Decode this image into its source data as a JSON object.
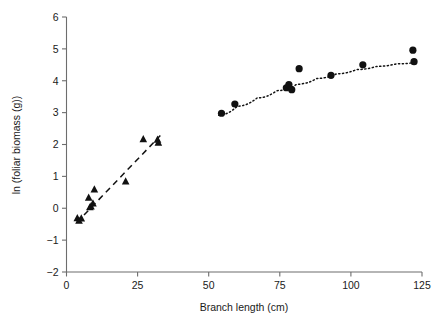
{
  "chart_data": {
    "type": "scatter",
    "title": "",
    "xlabel": "Branch length (cm)",
    "ylabel": "ln (foliar biomass (g))",
    "xlim": [
      0,
      125
    ],
    "ylim": [
      -2,
      6
    ],
    "xticks": [
      0,
      25,
      50,
      75,
      100,
      125
    ],
    "xtick_labels": [
      "0",
      "25",
      "50",
      "75",
      "100",
      "125"
    ],
    "yticks": [
      -2,
      -1,
      0,
      1,
      2,
      3,
      4,
      5,
      6
    ],
    "ytick_labels": [
      "−2",
      "−1",
      "0",
      "1",
      "2",
      "3",
      "4",
      "5",
      "6"
    ],
    "grid": false,
    "legend": "none",
    "marker_color": "#111111",
    "axis_color": "#6d6d6d",
    "series": [
      {
        "name": "small branches",
        "marker": "triangle",
        "points": [
          {
            "x": 3.8,
            "y": -0.32
          },
          {
            "x": 4.4,
            "y": -0.4
          },
          {
            "x": 5.2,
            "y": -0.33
          },
          {
            "x": 7.8,
            "y": 0.32
          },
          {
            "x": 8.2,
            "y": 0.02
          },
          {
            "x": 8.6,
            "y": 0.05
          },
          {
            "x": 9.3,
            "y": 0.14
          },
          {
            "x": 9.8,
            "y": 0.58
          },
          {
            "x": 20.8,
            "y": 0.83
          },
          {
            "x": 27.0,
            "y": 2.16
          },
          {
            "x": 32.0,
            "y": 2.14
          },
          {
            "x": 32.3,
            "y": 2.05
          }
        ],
        "fit": {
          "style": "dashed",
          "x_start": 3.6,
          "y_start": -0.45,
          "x_end": 33.0,
          "y_end": 2.28
        }
      },
      {
        "name": "large branches",
        "marker": "circle",
        "points": [
          {
            "x": 54.5,
            "y": 2.98
          },
          {
            "x": 59.2,
            "y": 3.27
          },
          {
            "x": 77.3,
            "y": 3.78
          },
          {
            "x": 78.2,
            "y": 3.88
          },
          {
            "x": 79.2,
            "y": 3.72
          },
          {
            "x": 81.8,
            "y": 4.38
          },
          {
            "x": 93.0,
            "y": 4.17
          },
          {
            "x": 104.2,
            "y": 4.5
          },
          {
            "x": 121.8,
            "y": 4.96
          },
          {
            "x": 122.2,
            "y": 4.6
          }
        ],
        "fit": {
          "style": "dotted",
          "curve_points": [
            {
              "x": 53.5,
              "y": 2.92
            },
            {
              "x": 60.0,
              "y": 3.2
            },
            {
              "x": 67.0,
              "y": 3.46
            },
            {
              "x": 74.0,
              "y": 3.69
            },
            {
              "x": 81.0,
              "y": 3.89
            },
            {
              "x": 88.0,
              "y": 4.07
            },
            {
              "x": 95.0,
              "y": 4.22
            },
            {
              "x": 102.0,
              "y": 4.35
            },
            {
              "x": 109.0,
              "y": 4.45
            },
            {
              "x": 116.0,
              "y": 4.53
            },
            {
              "x": 123.0,
              "y": 4.58
            }
          ]
        }
      }
    ]
  }
}
